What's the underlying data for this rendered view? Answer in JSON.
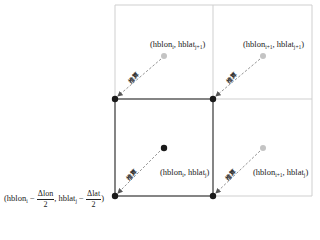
{
  "diagram": {
    "colors": {
      "grid_line": "#cfcfcf",
      "cell_border": "#444444",
      "known_point": "#1a1a1a",
      "estimated_point": "#c4c4c4",
      "arrow": "#888888"
    },
    "points": {
      "top_mid": {
        "base": "hblon",
        "base_sub": "i",
        "sep": ", ",
        "second": "hblat",
        "second_sub": "j+1"
      },
      "top_right": {
        "base": "hblon",
        "base_sub": "i+1",
        "sep": ", ",
        "second": "hblat",
        "second_sub": "j+1"
      },
      "center": {
        "base": "hblon",
        "base_sub": "i",
        "sep": ", ",
        "second": "hblat",
        "second_sub": "j"
      },
      "right_mid": {
        "base": "hblon",
        "base_sub": "i+1",
        "sep": ", ",
        "second": "hblat",
        "second_sub": "j"
      }
    },
    "corner_formula": {
      "open": "(",
      "lon": "hblon",
      "lon_sub": "i",
      "minus": " − ",
      "dlon_num": "Δlon",
      "dlon_den": "2",
      "comma": ", ",
      "lat": "hblat",
      "lat_sub": "j",
      "dlat_num": "Δlat",
      "dlat_den": "2",
      "close": ")"
    },
    "arrow_label": "推算"
  }
}
